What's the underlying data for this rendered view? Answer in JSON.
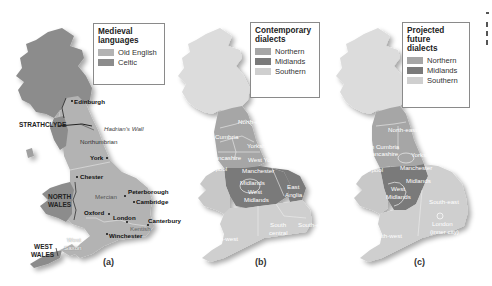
{
  "figure": {
    "panels": [
      {
        "id": "a",
        "caption": "(a)",
        "legend": {
          "title_line1": "Medieval",
          "title_line2": "languages",
          "items": [
            {
              "label": "Old English",
              "color": "#b3b3b3"
            },
            {
              "label": "Celtic",
              "color": "#8c8c8c"
            }
          ]
        },
        "places": {
          "edinburgh": "Edinburgh",
          "strathclyde": "STRATHCLYDE",
          "hadrians_wall": "Hadrian's Wall",
          "northumbrian": "Northumbrian",
          "york": "York",
          "chester": "Chester",
          "north_wales_1": "NORTH",
          "north_wales_2": "WALES",
          "mercian": "Mercian",
          "peterborough": "Peterborough",
          "cambridge": "Cambridge",
          "oxford": "Oxford",
          "london": "London",
          "canterbury": "Canterbury",
          "kentish": "Kentish",
          "winchester": "Winchester",
          "west_saxon_1": "West",
          "west_saxon_2": "Saxon",
          "west_wales_1": "WEST",
          "west_wales_2": "WALES"
        }
      },
      {
        "id": "b",
        "caption": "(b)",
        "legend": {
          "title_line1": "Contemporary",
          "title_line2": "dialects",
          "items": [
            {
              "label": "Northern",
              "color": "#a6a6a6"
            },
            {
              "label": "Midlands",
              "color": "#7a7a7a"
            },
            {
              "label": "Southern",
              "color": "#cfcfcf"
            }
          ]
        },
        "regions": {
          "north_east": "North-east",
          "cumbria": "Cumbria",
          "yorkshire": "Yorkshire",
          "lancashire": "Lancashire",
          "west_yorkshire": "West Yorkshire",
          "liverpool": "Liverpool",
          "manchester": "Manchester",
          "midlands": "Midlands",
          "west_midlands_1": "West",
          "west_midlands_2": "Midlands",
          "east_anglia_1": "East",
          "east_anglia_2": "Anglia",
          "south_central_1": "South",
          "south_central_2": "central",
          "south_east": "South-east",
          "south_west": "South-west"
        }
      },
      {
        "id": "c",
        "caption": "(c)",
        "legend": {
          "title_line1": "Projected",
          "title_line2": "future",
          "title_line3": "dialects",
          "items": [
            {
              "label": "Northern",
              "color": "#a6a6a6"
            },
            {
              "label": "Midlands",
              "color": "#7a7a7a"
            },
            {
              "label": "Southern",
              "color": "#cfcfcf"
            }
          ]
        },
        "regions": {
          "north_east": "North-east",
          "south_cumbria_1": "South Cumbria",
          "south_cumbria_2": "and Lancashire",
          "yorkshire": "Yorkshire",
          "liverpool": "Liverpool",
          "manchester": "Manchester",
          "midlands": "Midlands",
          "west_midlands_1": "West",
          "west_midlands_2": "Midlands",
          "south_east": "South-east",
          "london_1": "London",
          "london_2": "(inner city)",
          "south_west": "South-west"
        }
      }
    ]
  }
}
